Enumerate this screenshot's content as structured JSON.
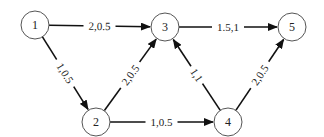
{
  "diagram": {
    "type": "directed-network",
    "nodes": [
      {
        "id": "1",
        "label": "1",
        "x": 35,
        "y": 25
      },
      {
        "id": "2",
        "label": "2",
        "x": 96,
        "y": 122
      },
      {
        "id": "3",
        "label": "3",
        "x": 165,
        "y": 27
      },
      {
        "id": "4",
        "label": "4",
        "x": 228,
        "y": 122
      },
      {
        "id": "5",
        "label": "5",
        "x": 292,
        "y": 27
      }
    ],
    "edges": [
      {
        "from": "1",
        "to": "3",
        "label": "2,0.5"
      },
      {
        "from": "3",
        "to": "5",
        "label": "1.5,1"
      },
      {
        "from": "1",
        "to": "2",
        "label": "1,0.5"
      },
      {
        "from": "2",
        "to": "3",
        "label": "2,0.5"
      },
      {
        "from": "2",
        "to": "4",
        "label": "1,0.5"
      },
      {
        "from": "4",
        "to": "3",
        "label": "1,1"
      },
      {
        "from": "4",
        "to": "5",
        "label": "2,0.5"
      }
    ],
    "node_radius": 14,
    "colors": {
      "edge": "#111111",
      "node_stroke": "#555555",
      "background": "#ffffff"
    }
  }
}
